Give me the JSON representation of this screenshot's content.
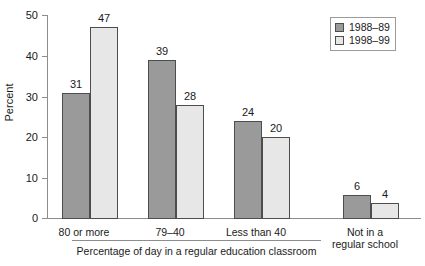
{
  "chart_data": {
    "type": "bar",
    "title": "",
    "subtitle": "",
    "xlabel": "Percentage of day in a regular education classroom",
    "ylabel": "Percent",
    "ylim": [
      0,
      50
    ],
    "yticks": [
      0,
      10,
      20,
      30,
      40,
      50
    ],
    "grid": false,
    "legend_position": "top-right",
    "categories": [
      "80 or more",
      "79–40",
      "Less than 40",
      "Not in a\nregular school"
    ],
    "category_lines": [
      [
        "80 or more"
      ],
      [
        "79–40"
      ],
      [
        "Less than 40"
      ],
      [
        "Not in a",
        "regular school"
      ]
    ],
    "bracket_note": "Percentage of day in a regular education classroom",
    "bracket_covers_categories": [
      "80 or more",
      "79–40",
      "Less than 40"
    ],
    "series": [
      {
        "name": "1988–89",
        "color": "#9a9a9a",
        "values": [
          31,
          39,
          24,
          6
        ]
      },
      {
        "name": "1998–99",
        "color": "#e7e7e7",
        "values": [
          47,
          28,
          20,
          4
        ]
      }
    ],
    "data_labels": [
      [
        31,
        47
      ],
      [
        39,
        28
      ],
      [
        24,
        20
      ],
      [
        6,
        4
      ]
    ],
    "colors": {
      "series_1988_89": "#9a9a9a",
      "series_1998_99": "#e7e7e7",
      "bar_outline": "#4d4d4d",
      "axis": "#8d8d8d",
      "text": "#1a1a1a",
      "background": "#ffffff"
    }
  },
  "axis": {
    "y_title": "Percent",
    "ticks": [
      "50",
      "40",
      "30",
      "20",
      "10",
      "0"
    ]
  },
  "legend": {
    "items": [
      {
        "label": "1988–89"
      },
      {
        "label": "1998–99"
      }
    ]
  },
  "labels": {
    "cat0_line0": "80 or more",
    "cat1_line0": "79–40",
    "cat2_line0": "Less than 40",
    "cat3_line0": "Not in a",
    "cat3_line1": "regular school",
    "bracket": "Percentage of day in a regular education classroom"
  },
  "values": {
    "g0s0": "31",
    "g0s1": "47",
    "g1s0": "39",
    "g1s1": "28",
    "g2s0": "24",
    "g2s1": "20",
    "g3s0": "6",
    "g3s1": "4"
  }
}
